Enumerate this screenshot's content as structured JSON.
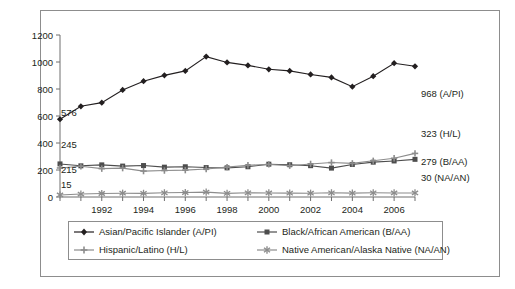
{
  "chart_data": {
    "type": "line",
    "title": "",
    "xlabel": "",
    "ylabel": "",
    "ylim": [
      0,
      1200
    ],
    "ytick_step": 200,
    "yticks": [
      0,
      200,
      400,
      600,
      800,
      1000,
      1200
    ],
    "x": [
      1990,
      1991,
      1992,
      1993,
      1994,
      1995,
      1996,
      1997,
      1998,
      1999,
      2000,
      2001,
      2002,
      2003,
      2004,
      2005,
      2006,
      2007
    ],
    "xtick_labels": [
      "1992",
      "1994",
      "1996",
      "1998",
      "2000",
      "2002",
      "2004",
      "2006"
    ],
    "xtick_years": [
      1992,
      1994,
      1996,
      1998,
      2000,
      2002,
      2004,
      2006
    ],
    "grid": false,
    "legend_position": "bottom",
    "series": [
      {
        "name": "Asian/Pacific Islander (A/PI)",
        "short": "A/PI",
        "color": "#231f20",
        "marker": "diamond",
        "start_label": "576",
        "end_label": "968 (A/PI)",
        "values": [
          576,
          672,
          699,
          793,
          858,
          901,
          934,
          1040,
          997,
          975,
          946,
          934,
          908,
          886,
          817,
          895,
          991,
          968
        ]
      },
      {
        "name": "Black/African American (B/AA)",
        "short": "B/AA",
        "color": "#4d4d4d",
        "marker": "square",
        "start_label": "245",
        "end_label": "279 (B/AA)",
        "values": [
          245,
          231,
          238,
          229,
          233,
          221,
          224,
          218,
          216,
          224,
          243,
          239,
          232,
          214,
          241,
          258,
          267,
          279
        ]
      },
      {
        "name": "Hispanic/Latino (H/L)",
        "short": "H/L",
        "color": "#8c8c8c",
        "marker": "plus",
        "start_label": "215",
        "end_label": "323 (H/L)",
        "values": [
          215,
          228,
          210,
          214,
          192,
          196,
          199,
          207,
          221,
          235,
          242,
          232,
          245,
          255,
          249,
          268,
          287,
          323
        ]
      },
      {
        "name": "Native American/Alaska Native (NA/AN)",
        "short": "NA/AN",
        "color": "#8c8c8c",
        "marker": "asterisk",
        "start_label": "15",
        "end_label": "30 (NA/AN)",
        "values": [
          15,
          22,
          26,
          28,
          27,
          31,
          33,
          36,
          27,
          31,
          30,
          29,
          28,
          31,
          29,
          31,
          30,
          30
        ]
      }
    ],
    "start_annotations": [
      "576",
      "245",
      "215",
      "15"
    ],
    "end_annotations": [
      "968 (A/PI)",
      "323 (H/L)",
      "279 (B/AA)",
      "30 (NA/AN)"
    ]
  },
  "legend": {
    "items": [
      {
        "label": "Asian/Pacific Islander (A/PI)",
        "marker": "diamond",
        "color": "#231f20"
      },
      {
        "label": "Black/African American (B/AA)",
        "marker": "square",
        "color": "#4d4d4d"
      },
      {
        "label": "Hispanic/Latino (H/L)",
        "marker": "plus",
        "color": "#8c8c8c"
      },
      {
        "label": "Native American/Alaska Native (NA/AN)",
        "marker": "asterisk",
        "color": "#8c8c8c"
      }
    ]
  },
  "colors": {
    "frame": "#8d8d8d",
    "axis": "#6f6f6f",
    "text": "#231f20",
    "background": "#ffffff"
  }
}
